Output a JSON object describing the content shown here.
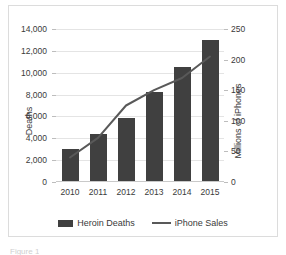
{
  "chart_data": {
    "type": "bar",
    "title": "",
    "subtitle": "",
    "categories": [
      "2010",
      "2011",
      "2012",
      "2013",
      "2014",
      "2015"
    ],
    "xlabel": "",
    "grid": true,
    "legend_position": "bottom",
    "series": [
      {
        "name": "Heroin Deaths",
        "type": "bar",
        "axis": "left",
        "color": "#404040",
        "values": [
          3000,
          4400,
          5900,
          8200,
          10500,
          12990
        ]
      },
      {
        "name": "iPhone Sales",
        "type": "line",
        "axis": "right",
        "color": "#595959",
        "values": [
          40,
          72,
          125,
          150,
          170,
          205
        ]
      }
    ],
    "axes": {
      "left": {
        "label": "Deaths",
        "ylim": [
          0,
          14000
        ],
        "ticks": [
          0,
          2000,
          4000,
          6000,
          8000,
          10000,
          12000,
          14000
        ],
        "ticklabels": [
          "0",
          "2,000",
          "4,000",
          "6,000",
          "8,000",
          "10,000",
          "12,000",
          "14,000"
        ]
      },
      "right": {
        "label": "Millions of iPhones",
        "ylim": [
          0,
          250
        ],
        "ticks": [
          0,
          50,
          100,
          150,
          200,
          250
        ],
        "ticklabels": [
          "0",
          "50",
          "100",
          "150",
          "200",
          "250"
        ]
      }
    },
    "legend": [
      {
        "label": "Heroin Deaths",
        "marker": "bar-swatch"
      },
      {
        "label": "iPhone Sales",
        "marker": "line-swatch"
      }
    ]
  },
  "caption": {
    "text": "Figure 1"
  }
}
